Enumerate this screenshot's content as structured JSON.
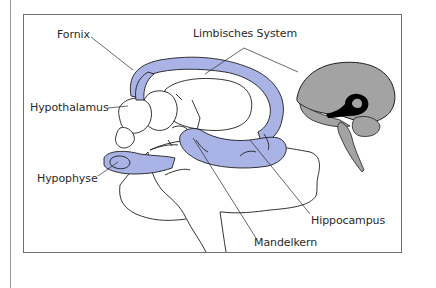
{
  "diagram": {
    "title": "",
    "colors": {
      "limbic_fill": "#a9b3e6",
      "outline": "#1e1e1e",
      "brain_inset_fill": "#a3a3a3",
      "brain_inset_highlight": "#000000",
      "frame": "#6e6e6e",
      "text": "#2a2a2a"
    },
    "labels": {
      "fornix": "Fornix",
      "limbisches_system": "Limbisches System",
      "hypothalamus": "Hypothalamus",
      "hypophyse": "Hypophyse",
      "hippocampus": "Hippocampus",
      "mandelkern": "Mandelkern"
    },
    "inset": {
      "name": "brain-sagittal-inset"
    }
  }
}
